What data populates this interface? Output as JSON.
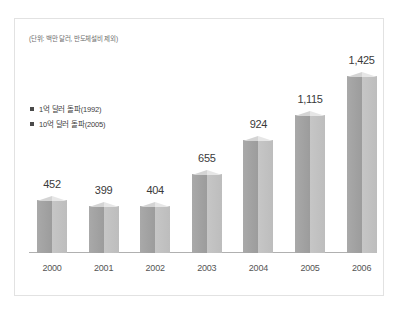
{
  "annotation": "(단위: 백만 달러, 반도체설비 제외)",
  "legend": {
    "items": [
      {
        "marker": "square-marker",
        "label": "1억 달러 돌파(1992)"
      },
      {
        "marker": "square-marker",
        "label": "10억 달러 돌파(2005)"
      }
    ]
  },
  "colors": {
    "bar_left_face": "#9c9c9c",
    "bar_right_face": "#c6c6c6",
    "bar_top_cap": "#e6e6e6",
    "baseline": "#b0b0b0",
    "panel_border": "#e2e2e2",
    "label_text": "#3a3a3a",
    "note_text": "#6d6d6d"
  },
  "chart_data": {
    "type": "bar",
    "title": "",
    "subtitle": "",
    "xlabel": "",
    "ylabel": "",
    "unit_note": "(단위: 백만 달러, 반도체설비 제외)",
    "categories": [
      "2000",
      "2001",
      "2002",
      "2003",
      "2004",
      "2005",
      "2006"
    ],
    "values": [
      452,
      399,
      404,
      655,
      924,
      1115,
      1425
    ],
    "value_labels": [
      "452",
      "399",
      "404",
      "655",
      "924",
      "1,115",
      "1,425"
    ],
    "ylim": [
      0,
      1560
    ],
    "grid": false,
    "legend_position": "left-middle",
    "legend_entries": [
      "1억 달러 돌파(1992)",
      "10억 달러 돌파(2005)"
    ],
    "series": [
      {
        "name": "수출액",
        "values": [
          452,
          399,
          404,
          655,
          924,
          1115,
          1425
        ]
      }
    ]
  }
}
